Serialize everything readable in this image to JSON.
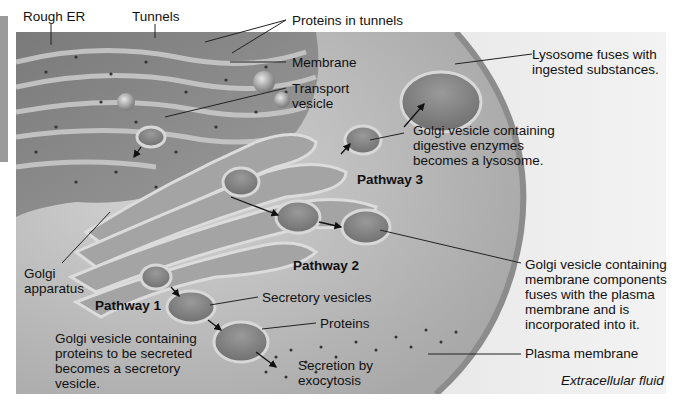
{
  "diagram": {
    "labels": {
      "rough_er": "Rough ER",
      "tunnels": "Tunnels",
      "proteins_in_tunnels": "Proteins in tunnels",
      "membrane": "Membrane",
      "transport_vesicle_1": "Transport",
      "transport_vesicle_2": "vesicle",
      "lysosome_fuses_1": "Lysosome fuses with",
      "lysosome_fuses_2": "ingested substances.",
      "golgi_digestive_1": "Golgi vesicle containing",
      "golgi_digestive_2": "digestive enzymes",
      "golgi_digestive_3": "becomes a lysosome.",
      "pathway_3": "Pathway 3",
      "pathway_2": "Pathway 2",
      "pathway_1": "Pathway 1",
      "golgi_apparatus_1": "Golgi",
      "golgi_apparatus_2": "apparatus",
      "secretory_vesicles": "Secretory vesicles",
      "proteins": "Proteins",
      "secretion_1": "Secretion by",
      "secretion_2": "exocytosis",
      "golgi_secreted_1": "Golgi vesicle containing",
      "golgi_secreted_2": "proteins to be secreted",
      "golgi_secreted_3": "becomes a secretory",
      "golgi_secreted_4": "vesicle.",
      "golgi_membrane_1": "Golgi vesicle containing",
      "golgi_membrane_2": "membrane components",
      "golgi_membrane_3": "fuses with the plasma",
      "golgi_membrane_4": "membrane and is",
      "golgi_membrane_5": "incorporated into it.",
      "plasma_membrane": "Plasma membrane",
      "extracellular_fluid": "Extracellular fluid"
    },
    "colors": {
      "background": "#ffffff",
      "cell_fill": "#c9c9c9",
      "er_fill": "#8f8f8f",
      "leader_line": "#222222",
      "text": "#111111"
    }
  }
}
